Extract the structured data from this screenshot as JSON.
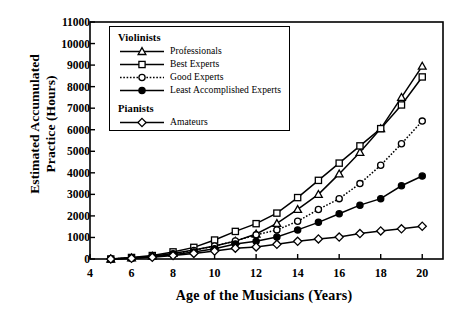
{
  "chart_data": {
    "type": "line",
    "title": "",
    "xlabel": "Age of the Musicians (Years)",
    "ylabel": "Estimated Accumulated\nPractice (Hours)",
    "xlim": [
      4,
      21
    ],
    "ylim": [
      0,
      11000
    ],
    "xticks": [
      4,
      6,
      8,
      10,
      12,
      14,
      16,
      18,
      20
    ],
    "yticks": [
      0,
      1000,
      2000,
      3000,
      4000,
      5000,
      6000,
      7000,
      8000,
      9000,
      10000,
      11000
    ],
    "grid": false,
    "legend_position": "upper-left-inset",
    "x": [
      5,
      6,
      7,
      8,
      9,
      10,
      11,
      12,
      13,
      14,
      15,
      16,
      17,
      18,
      19,
      20
    ],
    "series": [
      {
        "name": "Professionals",
        "group": "Violinists",
        "marker": "triangle-open",
        "line": "solid",
        "values": [
          0,
          50,
          130,
          260,
          420,
          600,
          830,
          1160,
          1650,
          2300,
          3000,
          3950,
          4950,
          6050,
          7500,
          8950
        ]
      },
      {
        "name": "Best Experts",
        "group": "Violinists",
        "marker": "square-open",
        "line": "solid",
        "values": [
          0,
          70,
          160,
          330,
          540,
          880,
          1280,
          1640,
          2130,
          2850,
          3650,
          4450,
          5250,
          6050,
          7150,
          8450
        ]
      },
      {
        "name": "Good Experts",
        "group": "Violinists",
        "marker": "circle-open",
        "line": "dotted",
        "values": [
          0,
          50,
          120,
          240,
          400,
          600,
          840,
          1120,
          1350,
          1750,
          2300,
          2800,
          3500,
          4350,
          5350,
          6400
        ]
      },
      {
        "name": "Least Accomplished Experts",
        "group": "Violinists",
        "marker": "circle-filled",
        "line": "solid",
        "values": [
          0,
          40,
          100,
          200,
          330,
          480,
          700,
          820,
          1020,
          1350,
          1700,
          2100,
          2500,
          2800,
          3400,
          3850
        ]
      },
      {
        "name": "Amateurs",
        "group": "Pianists",
        "marker": "diamond-open",
        "line": "solid",
        "values": [
          0,
          30,
          80,
          160,
          260,
          370,
          500,
          560,
          680,
          820,
          930,
          1020,
          1180,
          1300,
          1400,
          1520
        ]
      }
    ]
  },
  "axes": {
    "ylabel_text": "Estimated Accumulated\nPractice (Hours)",
    "xlabel_text": "Age of the Musicians (Years)",
    "ytick_labels": [
      "0",
      "1000",
      "2000",
      "3000",
      "4000",
      "5000",
      "6000",
      "7000",
      "8000",
      "9000",
      "10000",
      "11000"
    ],
    "xtick_labels": [
      "4",
      "6",
      "8",
      "10",
      "12",
      "14",
      "16",
      "18",
      "20"
    ]
  },
  "legend": {
    "groups": [
      {
        "title": "Violinists",
        "entries": [
          {
            "label": "Professionals",
            "marker": "triangle-open",
            "line": "solid"
          },
          {
            "label": "Best Experts",
            "marker": "square-open",
            "line": "solid"
          },
          {
            "label": "Good Experts",
            "marker": "circle-open",
            "line": "dotted"
          },
          {
            "label": "Least Accomplished Experts",
            "marker": "circle-filled",
            "line": "solid"
          }
        ]
      },
      {
        "title": "Pianists",
        "entries": [
          {
            "label": "Amateurs",
            "marker": "diamond-open",
            "line": "solid"
          }
        ]
      }
    ]
  },
  "colors": {
    "background": "#ffffff",
    "foreground": "#000000",
    "axis": "#000000"
  }
}
